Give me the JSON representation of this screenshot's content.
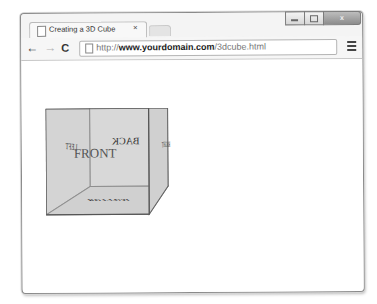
{
  "browser": {
    "tab": {
      "title": "Creating a 3D Cube",
      "close_glyph": "×"
    },
    "window_controls": {
      "minimize": "",
      "maximize": "",
      "close": "x"
    },
    "toolbar": {
      "back_glyph": "←",
      "forward_glyph": "→",
      "reload_glyph": "C"
    },
    "address_bar": {
      "url_prefix": "http://",
      "url_host": "www.yourdomain.com",
      "url_path": "/3dcube.html"
    }
  },
  "page": {
    "cube": {
      "faces": {
        "front": "FRONT",
        "back": "BACK",
        "left": "LEFT",
        "right": "RIGHT",
        "bottom": "BOTTOM"
      },
      "colors": {
        "face_fill": "#d3d3d3",
        "edge": "#555555"
      }
    }
  }
}
